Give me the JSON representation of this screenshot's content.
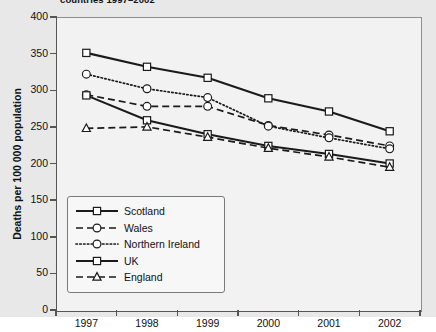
{
  "chart_data": {
    "type": "line",
    "title": "countries 1997–2002",
    "xlabel": "",
    "ylabel": "Deaths per 100 000 population",
    "x": [
      "1997",
      "1998",
      "1999",
      "2000",
      "2001",
      "2002"
    ],
    "categories": [
      "1997",
      "1998",
      "1999",
      "2000",
      "2001",
      "2002"
    ],
    "ylim": [
      0,
      400
    ],
    "yticks": [
      0,
      50,
      100,
      150,
      200,
      250,
      300,
      350,
      400
    ],
    "grid": false,
    "legend_position": "lower-left-inside",
    "series": [
      {
        "name": "Scotland",
        "values": [
          351,
          332,
          317,
          289,
          271,
          244
        ],
        "line_style": "solid",
        "marker": "square",
        "color": "#1a1a1a"
      },
      {
        "name": "Wales",
        "values": [
          294,
          278,
          278,
          252,
          239,
          224
        ],
        "line_style": "dashed",
        "marker": "circle",
        "color": "#1a1a1a"
      },
      {
        "name": "Northern Ireland",
        "values": [
          322,
          302,
          290,
          251,
          235,
          220
        ],
        "line_style": "dotted",
        "marker": "circle",
        "color": "#1a1a1a"
      },
      {
        "name": "UK",
        "values": [
          293,
          259,
          240,
          224,
          213,
          200
        ],
        "line_style": "solid",
        "marker": "square",
        "color": "#1a1a1a"
      },
      {
        "name": "England",
        "values": [
          248,
          250,
          236,
          221,
          209,
          195
        ],
        "line_style": "dashed",
        "marker": "triangle",
        "color": "#1a1a1a"
      }
    ]
  },
  "figure": {
    "title": "countries 1997–2002",
    "ylabel": "Deaths per 100 000 population",
    "ytick_labels": [
      "400",
      "350",
      "300",
      "250",
      "200",
      "150",
      "100",
      "50",
      "0"
    ],
    "xtick_labels": [
      "1997",
      "1998",
      "1999",
      "2000",
      "2001",
      "2002"
    ],
    "legend": {
      "items": [
        {
          "label": "Scotland"
        },
        {
          "label": "Wales"
        },
        {
          "label": "Northern Ireland"
        },
        {
          "label": "UK"
        },
        {
          "label": "England"
        }
      ]
    },
    "colors": {
      "line": "#1a1a1a",
      "plot_background": "#f2f2f2",
      "canvas_background": "#e8e8e8",
      "axis": "#555555",
      "legend_background": "#f7f7f7"
    }
  }
}
